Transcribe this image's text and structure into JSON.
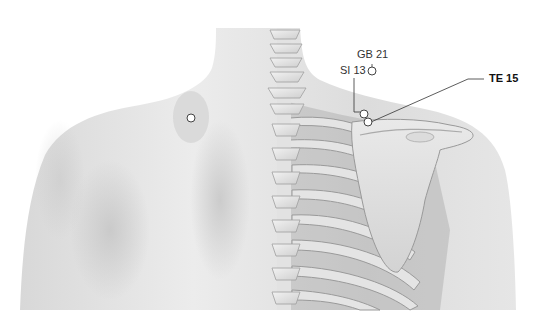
{
  "figure": {
    "colors": {
      "background": "#ffffff",
      "skin_light": "#eeeeee",
      "skin_mid": "#d9d9d9",
      "skin_shadow": "#c4c4c4",
      "bone": "#e6e6e6",
      "bone_shadow": "#a9a9a9",
      "intercostal": "#8a8a8a",
      "point_fill": "#ffffff",
      "point_stroke": "#444444",
      "leader_line": "#333333"
    }
  },
  "points": [
    {
      "id": "GB21",
      "label": "GB 21",
      "bold": false
    },
    {
      "id": "SI13",
      "label": "SI 13",
      "bold": false
    },
    {
      "id": "TE15",
      "label": "TE 15",
      "bold": true
    },
    {
      "id": "left-shoulder-point",
      "label": "",
      "bold": false
    }
  ]
}
